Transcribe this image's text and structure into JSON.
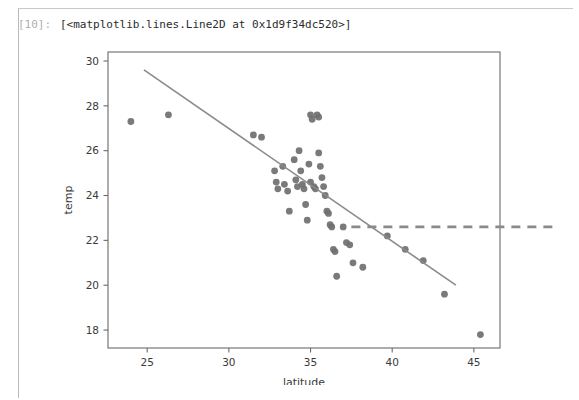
{
  "notebook": {
    "prompt_label": "[10]:",
    "output_text": "[<matplotlib.lines.Line2D at 0x1d9f34dc520>]"
  },
  "colors": {
    "point": "#6f6f6f",
    "regression_line": "#8a8a8a",
    "hline": "#8a8a8a",
    "axis": "#6a6a6a",
    "text": "#3a3a3a",
    "prompt": "#b0b0b0",
    "cell_rule": "#b8b8b8",
    "background": "#ffffff"
  },
  "chart_data": {
    "type": "scatter",
    "title": "",
    "xlabel": "latitude",
    "ylabel": "temp",
    "xlim": [
      22.6,
      46.6
    ],
    "ylim": [
      17.2,
      30.4
    ],
    "xticks": [
      25,
      30,
      35,
      40,
      45
    ],
    "yticks": [
      18,
      20,
      22,
      24,
      26,
      28,
      30
    ],
    "grid": false,
    "legend": null,
    "series": [
      {
        "name": "observations",
        "type": "scatter",
        "marker": "circle",
        "color": "#6f6f6f",
        "points": [
          [
            24.0,
            27.3
          ],
          [
            26.3,
            27.6
          ],
          [
            31.5,
            26.7
          ],
          [
            32.0,
            26.6
          ],
          [
            32.8,
            25.1
          ],
          [
            32.9,
            24.6
          ],
          [
            33.0,
            24.3
          ],
          [
            33.3,
            25.3
          ],
          [
            33.4,
            24.5
          ],
          [
            33.6,
            24.2
          ],
          [
            33.7,
            23.3
          ],
          [
            34.0,
            25.6
          ],
          [
            34.1,
            24.7
          ],
          [
            34.2,
            24.4
          ],
          [
            34.3,
            26.0
          ],
          [
            34.4,
            25.1
          ],
          [
            34.5,
            24.5
          ],
          [
            34.6,
            24.3
          ],
          [
            34.7,
            23.6
          ],
          [
            34.8,
            22.9
          ],
          [
            34.9,
            25.4
          ],
          [
            35.0,
            24.6
          ],
          [
            35.0,
            27.6
          ],
          [
            35.1,
            27.4
          ],
          [
            35.2,
            24.4
          ],
          [
            35.3,
            24.3
          ],
          [
            35.4,
            27.6
          ],
          [
            35.5,
            27.5
          ],
          [
            35.5,
            25.9
          ],
          [
            35.6,
            25.3
          ],
          [
            35.7,
            24.8
          ],
          [
            35.8,
            24.4
          ],
          [
            35.9,
            24.0
          ],
          [
            36.0,
            23.3
          ],
          [
            36.1,
            23.2
          ],
          [
            36.2,
            22.7
          ],
          [
            36.3,
            22.6
          ],
          [
            36.4,
            21.6
          ],
          [
            36.5,
            21.5
          ],
          [
            36.6,
            20.4
          ],
          [
            37.0,
            22.6
          ],
          [
            37.2,
            21.9
          ],
          [
            37.4,
            21.8
          ],
          [
            37.6,
            21.0
          ],
          [
            38.2,
            20.8
          ],
          [
            39.7,
            22.2
          ],
          [
            40.8,
            21.6
          ],
          [
            41.9,
            21.1
          ],
          [
            43.2,
            19.6
          ],
          [
            45.4,
            17.8
          ]
        ]
      },
      {
        "name": "regression-line",
        "type": "line",
        "style": "solid",
        "color": "#8a8a8a",
        "endpoints": [
          [
            24.8,
            29.6
          ],
          [
            43.9,
            20.0
          ]
        ]
      },
      {
        "name": "threshold-line",
        "type": "hline",
        "style": "dashed",
        "color": "#8a8a8a",
        "y": 22.6,
        "x_start": 37.5,
        "x_end": 50.0
      }
    ]
  }
}
